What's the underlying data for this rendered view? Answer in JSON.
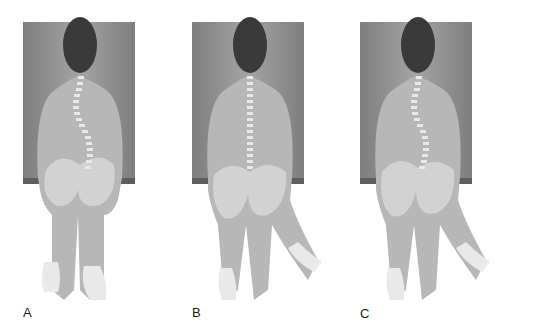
{
  "figure": {
    "panels": [
      {
        "label": "A",
        "spine": "curved",
        "pelvis_tilt": 0,
        "legs": "straight-down"
      },
      {
        "label": "B",
        "spine": "straight",
        "pelvis_tilt": 0,
        "legs": "shifted-right"
      },
      {
        "label": "C",
        "spine": "curved",
        "pelvis_tilt": 0,
        "legs": "shifted-right"
      }
    ],
    "colors": {
      "board": "#8f8f8f",
      "board_edge": "#5e5e5e",
      "skin": "#b9b9b9",
      "hair": "#3a3a3a",
      "vertebra": "#e6e6e6",
      "pelvis": "#d0d0d0"
    }
  }
}
